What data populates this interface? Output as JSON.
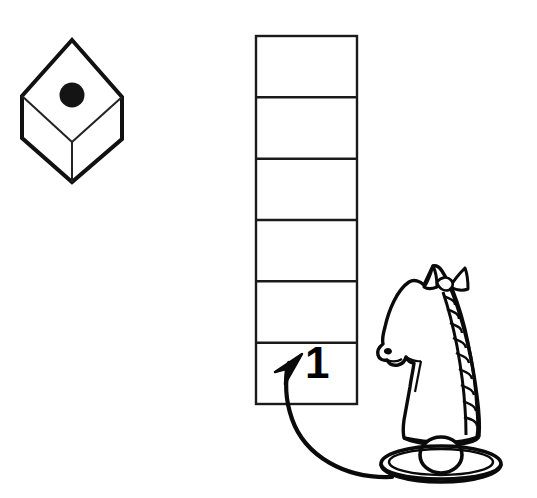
{
  "scene": {
    "title": "Dice and chess knight puzzle illustration",
    "background_color": "#ffffff",
    "ink_color": "#000000",
    "width": 537,
    "height": 498
  },
  "die": {
    "name": "isometric-die",
    "face_value": "1",
    "pip_count": 1,
    "description": "Isometric cube drawn as a hexagon outline with an internal Y, one black pip on the top face",
    "top_vertex": [
      72,
      40
    ],
    "left_vertex": [
      22,
      96
    ],
    "right_vertex": [
      122,
      97
    ],
    "bottom_vertex": [
      72,
      182
    ],
    "center_vertex": [
      72,
      142
    ],
    "pip": {
      "cx": 72,
      "cy": 95,
      "r": 12,
      "color": "#111111"
    }
  },
  "grid": {
    "name": "vertical-track",
    "columns": 1,
    "rows": 6,
    "x": 256,
    "y": 36,
    "width": 101,
    "height": 368,
    "cell_height": 61.3,
    "cells": [
      {
        "index": 1,
        "label": ""
      },
      {
        "index": 2,
        "label": ""
      },
      {
        "index": 3,
        "label": ""
      },
      {
        "index": 4,
        "label": ""
      },
      {
        "index": 5,
        "label": ""
      },
      {
        "index": 6,
        "label": "1"
      }
    ],
    "stroke_color": "#1a1a1a",
    "stroke_width": 2
  },
  "annotation": {
    "move_label": "1",
    "move_label_cell": 6,
    "arrow_name": "curved-move-arrow",
    "arrow_from": [
      392,
      477
    ],
    "arrow_to": [
      302,
      356
    ],
    "arrow_color": "#000000"
  },
  "knight": {
    "name": "chess-knight-piece",
    "piece": "knight",
    "color_side": "white",
    "description": "Line-art chess knight with braided mane, collar ball and round tiered base",
    "bounds": {
      "x": 378,
      "y": 262,
      "width": 130,
      "height": 205
    },
    "stroke_color": "#000000"
  }
}
